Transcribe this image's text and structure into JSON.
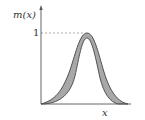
{
  "diagram": {
    "type": "type-2 fuzzy membership function (footprint of uncertainty)",
    "y_axis_label": "m(x)",
    "x_axis_label": "x",
    "y_tick_label": "1",
    "colors": {
      "axis": "#555555",
      "fill": "#a8a8a8",
      "outline": "#444444",
      "dashed": "#999999"
    }
  }
}
